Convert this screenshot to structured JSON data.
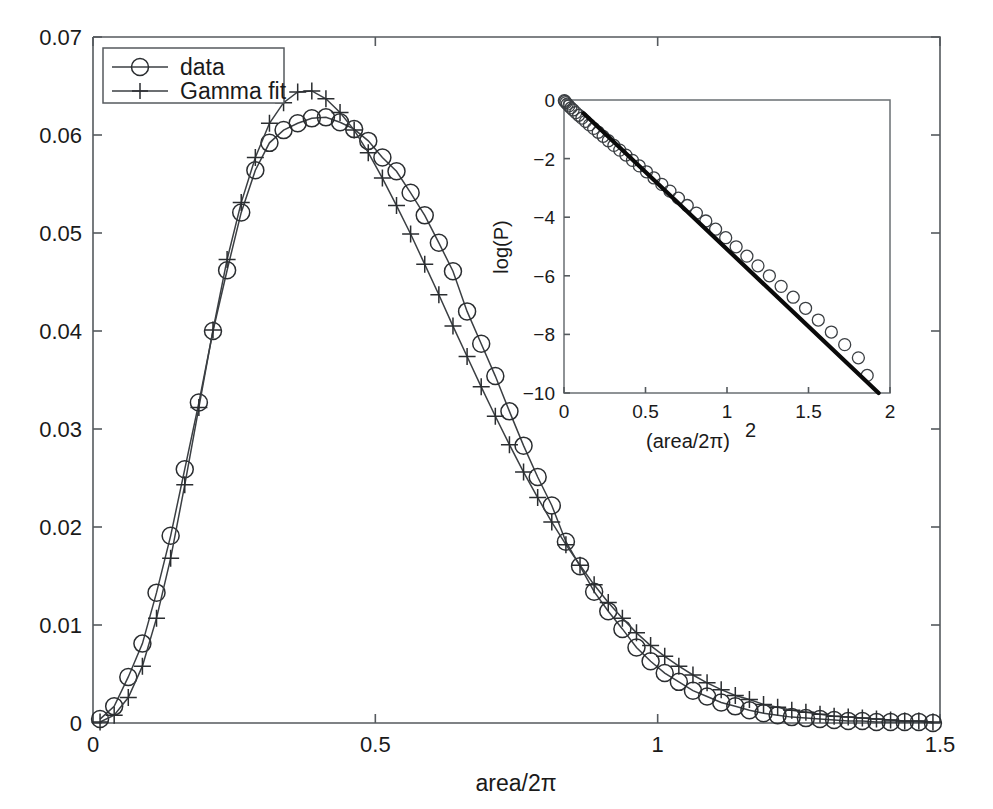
{
  "figure": {
    "background_color": "#ffffff",
    "line_color": "#3b3f43",
    "fit_color": "#0a0a0a",
    "text_color": "#1a1a1a"
  },
  "chart_data": {
    "type": "line",
    "title": "",
    "xlabel": "area/2π",
    "ylabel": "",
    "xlim": [
      0,
      1.5
    ],
    "ylim": [
      0,
      0.07
    ],
    "grid": false,
    "legend_position": "top-left",
    "xticks": [
      0,
      0.5,
      1,
      1.5
    ],
    "xtick_labels": [
      "0",
      "0.5",
      "1",
      "1.5"
    ],
    "yticks": [
      0,
      0.01,
      0.02,
      0.03,
      0.04,
      0.05,
      0.06,
      0.07
    ],
    "ytick_labels": [
      "0",
      "0.01",
      "0.02",
      "0.03",
      "0.04",
      "0.05",
      "0.06",
      "0.07"
    ],
    "x": [
      0.0125,
      0.0375,
      0.0625,
      0.0875,
      0.1125,
      0.1375,
      0.1625,
      0.1875,
      0.2125,
      0.2375,
      0.2625,
      0.2875,
      0.3125,
      0.3375,
      0.3625,
      0.3875,
      0.4125,
      0.4375,
      0.4625,
      0.4875,
      0.5125,
      0.5375,
      0.5625,
      0.5875,
      0.6125,
      0.6375,
      0.6625,
      0.6875,
      0.7125,
      0.7375,
      0.7625,
      0.7875,
      0.8125,
      0.8375,
      0.8625,
      0.8875,
      0.9125,
      0.9375,
      0.9625,
      0.9875,
      1.0125,
      1.0375,
      1.0625,
      1.0875,
      1.1125,
      1.1375,
      1.1625,
      1.1875,
      1.2125,
      1.2375,
      1.2625,
      1.2875,
      1.3125,
      1.3375,
      1.3625,
      1.3875,
      1.4125,
      1.4375,
      1.4625,
      1.4875
    ],
    "series": [
      {
        "name": "data",
        "marker": "circle",
        "values": [
          0.0004,
          0.0017,
          0.0047,
          0.0081,
          0.0133,
          0.0191,
          0.0259,
          0.0327,
          0.04,
          0.0462,
          0.0521,
          0.0564,
          0.0592,
          0.0605,
          0.0612,
          0.0617,
          0.0618,
          0.0613,
          0.0606,
          0.0594,
          0.0577,
          0.0563,
          0.0541,
          0.0518,
          0.049,
          0.0461,
          0.042,
          0.0387,
          0.0354,
          0.0318,
          0.0283,
          0.0251,
          0.0222,
          0.0185,
          0.016,
          0.0134,
          0.0114,
          0.0096,
          0.0077,
          0.0063,
          0.0051,
          0.0042,
          0.0033,
          0.0027,
          0.0021,
          0.0017,
          0.0013,
          0.001,
          0.0008,
          0.0006,
          0.0005,
          0.0004,
          0.0003,
          0.0002,
          0.0002,
          0.0001,
          0.0001,
          0.0001,
          0.0001,
          0.0
        ]
      },
      {
        "name": "Gamma fit",
        "marker": "plus",
        "values": [
          0.0001,
          0.0008,
          0.0026,
          0.0058,
          0.0107,
          0.0168,
          0.0243,
          0.0322,
          0.0401,
          0.0473,
          0.0531,
          0.0577,
          0.0612,
          0.0633,
          0.0644,
          0.0645,
          0.0637,
          0.0623,
          0.0605,
          0.0582,
          0.0556,
          0.0528,
          0.0499,
          0.0468,
          0.0437,
          0.0405,
          0.0374,
          0.0343,
          0.0313,
          0.0284,
          0.0256,
          0.023,
          0.0205,
          0.0182,
          0.0161,
          0.0141,
          0.0123,
          0.0107,
          0.0092,
          0.0079,
          0.0068,
          0.0058,
          0.0049,
          0.0041,
          0.0034,
          0.0028,
          0.0024,
          0.0019,
          0.0016,
          0.0013,
          0.0011,
          0.0009,
          0.0007,
          0.0006,
          0.0005,
          0.0004,
          0.0003,
          0.0002,
          0.0002,
          0.0001
        ]
      }
    ]
  },
  "legend": {
    "entries": [
      {
        "label": "data",
        "marker": "circle"
      },
      {
        "label": "Gamma fit",
        "marker": "plus"
      }
    ]
  },
  "inset": {
    "chart_data": {
      "type": "scatter",
      "title": "",
      "xlabel": "(area/2π)",
      "xlabel_exponent": "2",
      "ylabel": "log(P)",
      "xlim": [
        0,
        2
      ],
      "ylim": [
        -10,
        0
      ],
      "grid": false,
      "xticks": [
        0,
        0.5,
        1,
        1.5,
        2
      ],
      "xtick_labels": [
        "0",
        "0.5",
        "1",
        "1.5",
        "2"
      ],
      "yticks": [
        -10,
        -8,
        -6,
        -4,
        -2,
        0
      ],
      "ytick_labels": [
        "-10",
        "-8",
        "-6",
        "-4",
        "-2",
        "0"
      ],
      "series": [
        {
          "name": "data",
          "marker": "circle",
          "x": [
            0.002,
            0.006,
            0.012,
            0.02,
            0.03,
            0.042,
            0.056,
            0.072,
            0.09,
            0.11,
            0.132,
            0.156,
            0.182,
            0.21,
            0.24,
            0.272,
            0.306,
            0.342,
            0.38,
            0.42,
            0.462,
            0.506,
            0.552,
            0.6,
            0.65,
            0.702,
            0.756,
            0.812,
            0.87,
            0.93,
            0.992,
            1.056,
            1.122,
            1.19,
            1.26,
            1.332,
            1.406,
            1.482,
            1.56,
            1.64,
            1.722,
            1.806,
            1.86
          ],
          "y": [
            -0.02,
            -0.05,
            -0.09,
            -0.14,
            -0.2,
            -0.27,
            -0.34,
            -0.43,
            -0.52,
            -0.62,
            -0.73,
            -0.85,
            -0.97,
            -1.1,
            -1.24,
            -1.39,
            -1.55,
            -1.71,
            -1.88,
            -2.06,
            -2.25,
            -2.45,
            -2.66,
            -2.88,
            -3.11,
            -3.35,
            -3.6,
            -3.86,
            -4.13,
            -4.41,
            -4.7,
            -5.01,
            -5.33,
            -5.66,
            -6.0,
            -6.36,
            -6.73,
            -7.11,
            -7.51,
            -7.92,
            -8.35,
            -8.8,
            -9.4
          ]
        },
        {
          "name": "Gamma fit",
          "marker": "line",
          "x": [
            0.12,
            1.93
          ],
          "y": [
            -0.45,
            -10.0
          ]
        }
      ]
    }
  }
}
